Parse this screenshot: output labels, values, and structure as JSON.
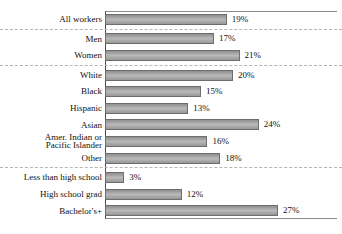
{
  "chart_data": {
    "type": "bar",
    "orientation": "horizontal",
    "title": "",
    "xlabel": "",
    "ylabel": "",
    "xlim": [
      0,
      37
    ],
    "grid": false,
    "legend": false,
    "categories": [
      "All workers",
      "Men",
      "Women",
      "White",
      "Black",
      "Hispanic",
      "Asian",
      "Amer. Indian or\nPacific Islander",
      "Other",
      "Less than high school",
      "High school grad",
      "Bachelor's+"
    ],
    "values": [
      19,
      17,
      21,
      20,
      15,
      13,
      24,
      16,
      18,
      3,
      12,
      27
    ],
    "value_labels": [
      "19%",
      "17%",
      "21%",
      "20%",
      "15%",
      "13%",
      "24%",
      "16%",
      "18%",
      "3%",
      "12%",
      "27%"
    ],
    "group_breaks_after": [
      0,
      2,
      8
    ],
    "separator_style": "dashed",
    "colors": {
      "bar_fill": "#a9a9a9",
      "bar_border": "#6d6d6d",
      "frame": "#8a8a8a",
      "axis": "#4a4a4a",
      "separator": "#b5b5b5",
      "text": "#111111"
    }
  }
}
